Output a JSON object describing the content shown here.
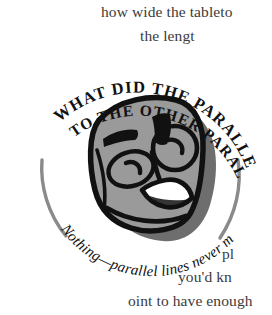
{
  "page": {
    "background_color": "#ffffff",
    "ink_color": "#1a1a1a",
    "body_text_color": "#3b3b3b",
    "face_fill_color": "#9a9a9a",
    "shadow_color": "#6e6e6e",
    "arc_color": "#8a8a8a"
  },
  "body_text": {
    "line_1": "how wide the tableto",
    "line_2": "the lengt",
    "line_3": "pl",
    "line_4": "you'd kn",
    "line_5": "oint to have enough"
  },
  "joke": {
    "question_line_1": "WHAT DID THE PARALLEL LINE SAY",
    "question_line_2": "TO THE OTHER PARALLEL LINE?",
    "answer": "Nothing—parallel lines never meet!"
  },
  "illustration": {
    "name": "cartoon-face",
    "description": "hand-drawn smiling square face in gray with bold black outlines",
    "features": [
      "left-eyebrow",
      "right-eyebrow",
      "left-eye",
      "right-eye",
      "nose",
      "smiling-mouth",
      "chin",
      "drop-shadow"
    ]
  },
  "decoration": {
    "left_arc": "curved-rule-left",
    "right_arc": "curved-rule-right"
  }
}
